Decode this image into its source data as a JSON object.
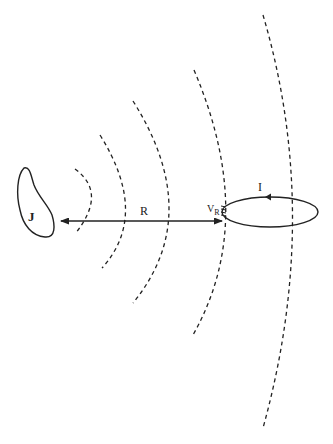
{
  "figure": {
    "type": "physics diagram",
    "labels": {
      "source": "J",
      "distance": "R",
      "voltage_main": "V",
      "voltage_sub": "R",
      "current": "I"
    },
    "elements": {
      "source_region": "current distribution J (blob)",
      "arrow": "double-headed arrow of length R from source to loop",
      "wavefronts": 5,
      "loop": "receiving loop antenna with current I and terminal voltage V_R"
    },
    "colors": {
      "stroke": "#222222",
      "background": "#ffffff"
    }
  }
}
